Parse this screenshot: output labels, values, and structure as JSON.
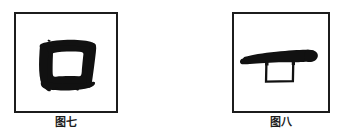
{
  "page": {
    "background_color": "#ffffff",
    "ink_color": "#111111",
    "frame_color": "#1c1c1c"
  },
  "figures": [
    {
      "id": "figure-seven",
      "caption": "图七",
      "glyph_name": "ancient-character-kou-square",
      "glyph_description": "刷笔书写的方框字形（口／回），粗重笔画围成白色内方",
      "frame": {
        "x": 14,
        "y": 12,
        "width": 104,
        "height": 101
      }
    },
    {
      "id": "figure-eight",
      "caption": "图八",
      "glyph_name": "ancient-character-horizontal-stroke-with-box",
      "glyph_description": "一道楔形横笔，下悬细线小方框",
      "frame": {
        "x": 232,
        "y": 12,
        "width": 98,
        "height": 101
      }
    }
  ]
}
